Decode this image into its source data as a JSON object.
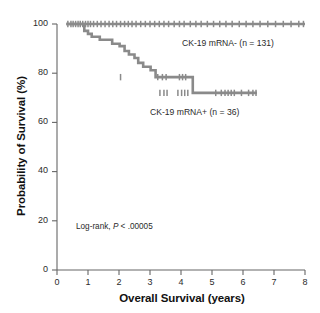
{
  "chart_data": {
    "type": "line",
    "title": "",
    "xlabel": "Overall Survival (years)",
    "ylabel": "Probability of Survival (%)",
    "xlim": [
      0,
      8
    ],
    "ylim": [
      0,
      100
    ],
    "xticks": [
      "0",
      "1",
      "2",
      "3",
      "4",
      "5",
      "6",
      "7",
      "8"
    ],
    "yticks": [
      "0",
      "20",
      "40",
      "60",
      "80",
      "100"
    ],
    "grid": false,
    "legend_position": "inline-annotations",
    "annotations": [
      {
        "name": "log-rank",
        "prefix": "Log-rank, ",
        "italic": "P",
        "suffix": " < .00005"
      }
    ],
    "series": [
      {
        "name": "CK-19 mRNA- (n = 131)",
        "label": "CK-19 mRNA- (n = 131)",
        "n": 131,
        "color": "#8a8a8a",
        "steps": [
          [
            0.3,
            100
          ],
          [
            8.0,
            100
          ]
        ],
        "censor_x": [
          0.35,
          0.45,
          0.52,
          0.6,
          0.68,
          0.75,
          0.83,
          0.92,
          1.0,
          1.08,
          1.18,
          1.3,
          1.42,
          1.55,
          1.68,
          1.8,
          1.92,
          2.05,
          2.18,
          2.3,
          2.42,
          2.55,
          2.7,
          2.85,
          3.0,
          3.15,
          3.3,
          3.45,
          3.6,
          3.78,
          3.95,
          4.1,
          4.3,
          4.48,
          4.65,
          4.85,
          5.05,
          5.25,
          5.45,
          5.65,
          5.88,
          6.1,
          6.32,
          6.55,
          6.8,
          7.05,
          7.3,
          7.55,
          7.8,
          7.95
        ],
        "censor_y": 100
      },
      {
        "name": "CK-19 mRNA+ (n = 36)",
        "label": "CK-19 mRNA+ (n = 36)",
        "n": 36,
        "color": "#8a8a8a",
        "steps": [
          [
            0.3,
            100
          ],
          [
            0.88,
            100
          ],
          [
            0.88,
            97.2
          ],
          [
            1.0,
            97.2
          ],
          [
            1.0,
            96.0
          ],
          [
            1.12,
            96.0
          ],
          [
            1.12,
            94.8
          ],
          [
            1.38,
            94.8
          ],
          [
            1.38,
            93.6
          ],
          [
            1.78,
            93.6
          ],
          [
            1.78,
            92.0
          ],
          [
            2.02,
            92.0
          ],
          [
            2.02,
            91.0
          ],
          [
            2.18,
            91.0
          ],
          [
            2.18,
            89.0
          ],
          [
            2.32,
            89.0
          ],
          [
            2.32,
            87.6
          ],
          [
            2.5,
            87.6
          ],
          [
            2.5,
            86.2
          ],
          [
            2.62,
            86.2
          ],
          [
            2.62,
            84.2
          ],
          [
            2.78,
            84.2
          ],
          [
            2.78,
            82.6
          ],
          [
            3.02,
            82.6
          ],
          [
            3.02,
            81.2
          ],
          [
            3.18,
            81.2
          ],
          [
            3.18,
            78.4
          ],
          [
            3.62,
            78.4
          ],
          [
            3.88,
            78.4
          ],
          [
            4.38,
            78.4
          ],
          [
            4.38,
            72.0
          ],
          [
            5.0,
            72.0
          ],
          [
            6.45,
            72.0
          ]
        ],
        "censor_x": [
          3.32,
          3.45,
          3.55,
          3.9,
          4.02,
          4.12,
          4.22,
          5.12,
          5.3,
          5.42,
          5.52,
          5.62,
          5.72,
          5.95,
          6.18,
          6.32,
          6.42
        ],
        "censor_y": 72.0,
        "censor_upper": [
          2.05,
          3.25,
          3.4,
          3.52,
          3.95,
          4.05,
          4.15
        ]
      }
    ]
  }
}
